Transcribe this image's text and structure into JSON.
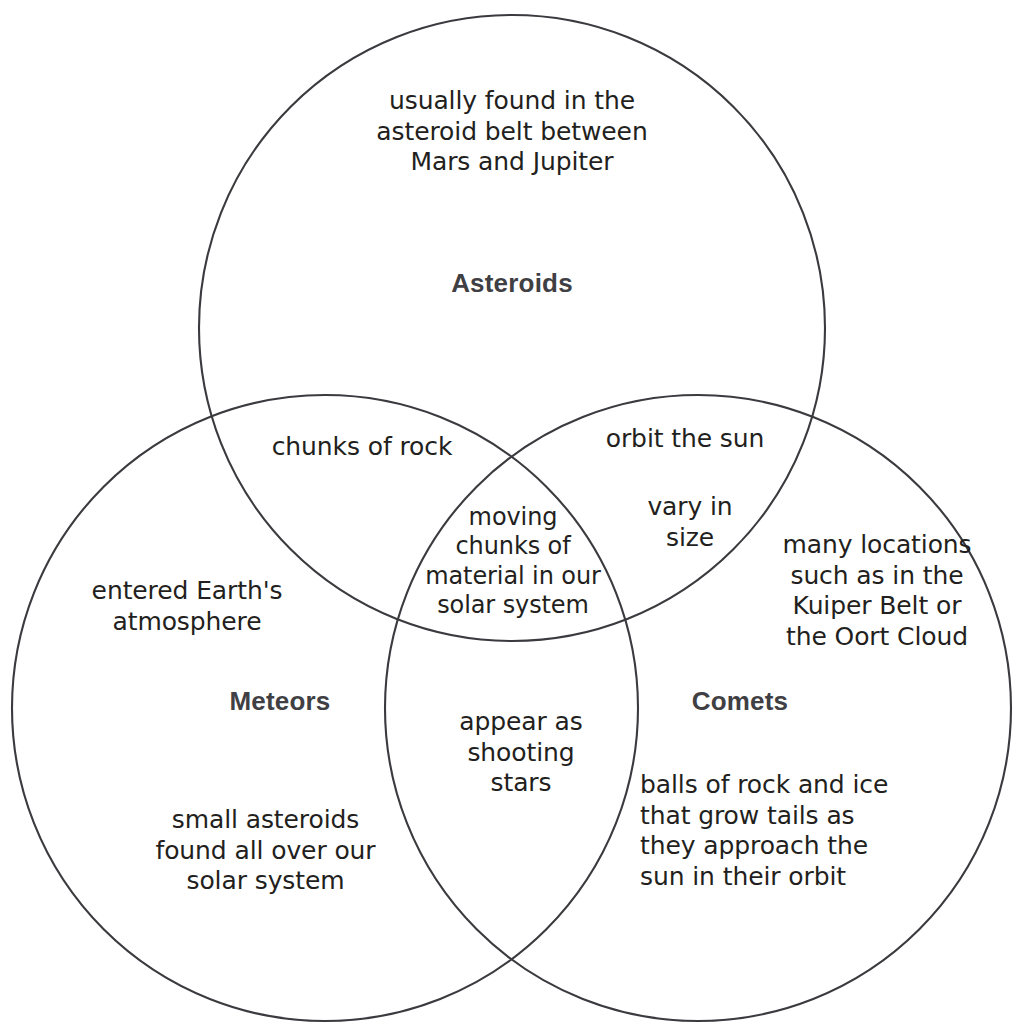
{
  "diagram": {
    "type": "venn",
    "title_artifact": "l",
    "sets": [
      {
        "id": "asteroids",
        "label": "Asteroids",
        "position": "top",
        "unique_items": [
          "usually found in the\nasteroid belt between\nMars and Jupiter"
        ]
      },
      {
        "id": "meteors",
        "label": "Meteors",
        "position": "bottom-left",
        "unique_items": [
          "entered Earth's\natmosphere",
          "small asteroids\nfound all over our\nsolar system"
        ]
      },
      {
        "id": "comets",
        "label": "Comets",
        "position": "bottom-right",
        "unique_items": [
          "many locations\nsuch as in the\nKuiper Belt or\nthe Oort Cloud",
          "balls of rock and ice\nthat grow tails as\nthey approach the\nsun in their orbit"
        ]
      }
    ],
    "intersections": [
      {
        "id": "asteroids-meteors",
        "sets": [
          "asteroids",
          "meteors"
        ],
        "text": "chunks of rock"
      },
      {
        "id": "asteroids-comets-top",
        "sets": [
          "asteroids",
          "comets"
        ],
        "text": "orbit the sun"
      },
      {
        "id": "asteroids-comets-bottom",
        "sets": [
          "asteroids",
          "comets"
        ],
        "text": "vary in\nsize"
      },
      {
        "id": "meteors-comets",
        "sets": [
          "meteors",
          "comets"
        ],
        "text": "appear as\nshooting\nstars"
      },
      {
        "id": "all-three",
        "sets": [
          "asteroids",
          "meteors",
          "comets"
        ],
        "text": "moving\nchunks of\nmaterial in our\nsolar system"
      }
    ],
    "colors": {
      "stroke": "#3a3a3f",
      "body_text": "#231f20",
      "label_text": "#3f3f44",
      "background": "#ffffff"
    },
    "geometry": {
      "circle_radius": 313,
      "circles": [
        {
          "id": "asteroids",
          "cx": 512,
          "cy": 328
        },
        {
          "id": "meteors",
          "cx": 325,
          "cy": 708
        },
        {
          "id": "comets",
          "cx": 698,
          "cy": 708
        }
      ]
    }
  }
}
